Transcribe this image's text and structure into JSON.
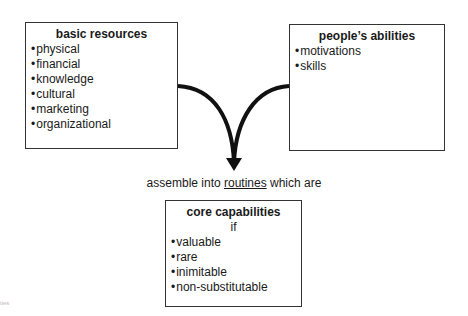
{
  "diagram": {
    "box_basic_resources": {
      "title": "basic resources",
      "items": [
        "physical",
        "financial",
        "knowledge",
        "cultural",
        "marketing",
        "organizational"
      ]
    },
    "box_peoples_abilities": {
      "title": "people’s abilities",
      "items": [
        "motivations",
        "skills"
      ]
    },
    "connector_caption": {
      "before": "assemble into ",
      "underlined": "routines",
      "after": " which are"
    },
    "box_core_capabilities": {
      "title": "core capabilities",
      "condition": "if",
      "items": [
        "valuable",
        "rare",
        "inimitable",
        "non-substitutable"
      ]
    },
    "corner_fragment": "ties",
    "colors": {
      "stroke": "#111111",
      "border": "#333333",
      "text": "#1a1a1a"
    }
  }
}
